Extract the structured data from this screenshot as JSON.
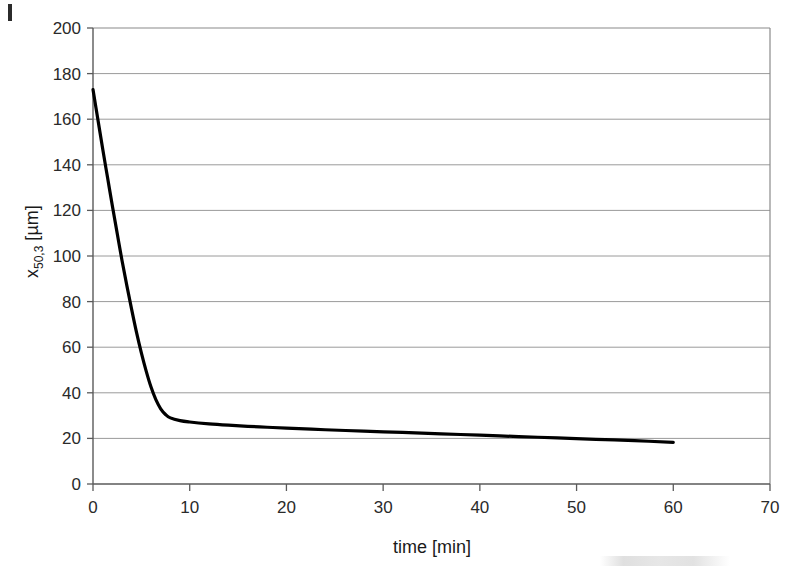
{
  "figure": {
    "corner_mark": "page-edge-mark"
  },
  "chart_data": {
    "type": "line",
    "title": "",
    "xlabel": "time [min]",
    "ylabel": "x50,3 [µm]",
    "ylabel_base": "x",
    "ylabel_subscript": "50,3",
    "ylabel_unit": "[µm]",
    "xlim": [
      0,
      70
    ],
    "ylim": [
      0,
      200
    ],
    "xticks": [
      0,
      10,
      20,
      30,
      40,
      50,
      60,
      70
    ],
    "xtick_labels": [
      "0",
      "10",
      "20",
      "30",
      "40",
      "50",
      "60",
      "70"
    ],
    "yticks": [
      0,
      20,
      40,
      60,
      80,
      100,
      120,
      140,
      160,
      180,
      200
    ],
    "ytick_labels": [
      "0",
      "20",
      "40",
      "60",
      "80",
      "100",
      "120",
      "140",
      "160",
      "180",
      "200"
    ],
    "grid": "horizontal",
    "legend": null,
    "line_color": "#000000",
    "line_width": 3.2,
    "series": [
      {
        "name": "x50,3",
        "x": [
          0,
          0.5,
          1,
          1.5,
          2,
          2.5,
          3,
          3.5,
          4,
          4.5,
          5,
          5.5,
          6,
          6.5,
          7,
          7.5,
          8,
          9,
          10,
          12,
          14,
          16,
          18,
          20,
          24,
          28,
          32,
          36,
          40,
          44,
          48,
          52,
          56,
          60
        ],
        "y": [
          173,
          160,
          147,
          134.5,
          122,
          110,
          98,
          87,
          76.5,
          66.5,
          57.5,
          49.5,
          42.5,
          37,
          33,
          30.5,
          29,
          27.8,
          27.2,
          26.4,
          25.8,
          25.3,
          24.9,
          24.5,
          23.8,
          23.2,
          22.6,
          22.0,
          21.4,
          20.8,
          20.2,
          19.6,
          19.0,
          18.3
        ]
      }
    ]
  }
}
